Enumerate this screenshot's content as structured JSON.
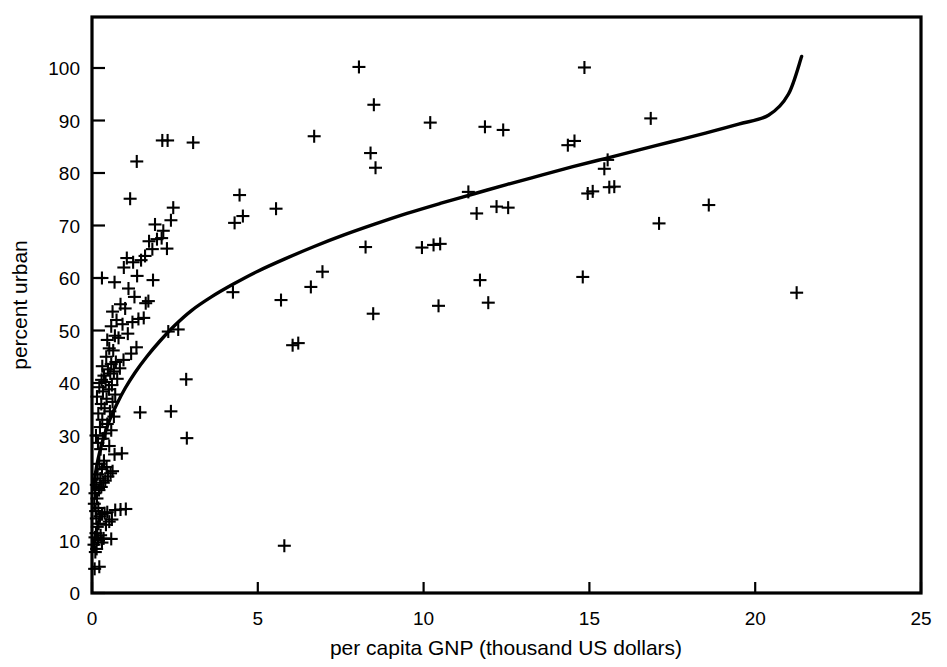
{
  "chart_data": {
    "type": "scatter",
    "title": "",
    "xlabel": "per capita GNP (thousand US dollars)",
    "ylabel": "percent urban",
    "xlim": [
      0,
      25
    ],
    "ylim": [
      0,
      100
    ],
    "xticks": [
      0,
      5,
      10,
      15,
      20,
      25
    ],
    "yticks": [
      0,
      10,
      20,
      30,
      40,
      50,
      60,
      70,
      80,
      90,
      100
    ],
    "xtick_labels": [
      "0",
      "5",
      "10",
      "15",
      "20",
      "25"
    ],
    "ytick_labels": [
      "0",
      "10",
      "20",
      "30",
      "40",
      "50",
      "60",
      "70",
      "80",
      "90",
      "100"
    ],
    "grid": false,
    "legend": null,
    "marker": "plus",
    "series": [
      {
        "name": "countries",
        "marker": "+",
        "points": [
          [
            0.08,
            4.6
          ],
          [
            0.22,
            5.0
          ],
          [
            0.1,
            7.8
          ],
          [
            0.14,
            8.4
          ],
          [
            0.06,
            9.2
          ],
          [
            0.3,
            9.6
          ],
          [
            0.18,
            10.2
          ],
          [
            0.09,
            10.6
          ],
          [
            0.26,
            11.0
          ],
          [
            0.12,
            11.4
          ],
          [
            0.35,
            10.4
          ],
          [
            0.58,
            10.3
          ],
          [
            0.16,
            12.6
          ],
          [
            0.2,
            13.2
          ],
          [
            0.42,
            13.0
          ],
          [
            0.52,
            13.6
          ],
          [
            0.6,
            14.0
          ],
          [
            0.13,
            14.2
          ],
          [
            0.24,
            14.6
          ],
          [
            0.3,
            15.0
          ],
          [
            0.38,
            15.2
          ],
          [
            0.46,
            15.4
          ],
          [
            0.7,
            15.8
          ],
          [
            0.86,
            15.9
          ],
          [
            1.02,
            16.0
          ],
          [
            0.11,
            15.6
          ],
          [
            0.19,
            16.2
          ],
          [
            0.07,
            17.0
          ],
          [
            0.15,
            18.0
          ],
          [
            0.09,
            19.0
          ],
          [
            0.21,
            19.6
          ],
          [
            0.28,
            20.2
          ],
          [
            0.13,
            20.6
          ],
          [
            0.34,
            21.0
          ],
          [
            0.4,
            21.4
          ],
          [
            0.25,
            21.8
          ],
          [
            0.48,
            22.2
          ],
          [
            0.17,
            22.6
          ],
          [
            0.56,
            22.8
          ],
          [
            0.62,
            23.2
          ],
          [
            0.3,
            23.6
          ],
          [
            0.44,
            24.0
          ],
          [
            0.22,
            24.6
          ],
          [
            0.36,
            25.2
          ],
          [
            0.68,
            26.4
          ],
          [
            0.9,
            26.6
          ],
          [
            2.86,
            29.5
          ],
          [
            0.26,
            27.4
          ],
          [
            0.52,
            28.0
          ],
          [
            0.18,
            28.6
          ],
          [
            0.33,
            29.4
          ],
          [
            0.12,
            30.0
          ],
          [
            0.41,
            30.4
          ],
          [
            0.58,
            31.0
          ],
          [
            0.24,
            31.6
          ],
          [
            0.46,
            32.2
          ],
          [
            0.31,
            33.0
          ],
          [
            0.66,
            33.6
          ],
          [
            0.19,
            34.2
          ],
          [
            0.54,
            34.6
          ],
          [
            1.45,
            34.4
          ],
          [
            2.38,
            34.6
          ],
          [
            0.38,
            35.2
          ],
          [
            0.28,
            36.0
          ],
          [
            0.62,
            36.4
          ],
          [
            0.44,
            37.0
          ],
          [
            0.15,
            37.4
          ],
          [
            0.7,
            37.8
          ],
          [
            0.33,
            38.4
          ],
          [
            0.51,
            38.8
          ],
          [
            0.22,
            39.2
          ],
          [
            0.6,
            39.6
          ],
          [
            0.41,
            40.2
          ],
          [
            0.29,
            40.6
          ],
          [
            0.76,
            40.8
          ],
          [
            2.84,
            40.7
          ],
          [
            0.36,
            41.4
          ],
          [
            0.55,
            41.8
          ],
          [
            0.66,
            42.2
          ],
          [
            0.48,
            42.6
          ],
          [
            0.84,
            42.8
          ],
          [
            0.31,
            43.2
          ],
          [
            0.58,
            43.6
          ],
          [
            0.72,
            44.0
          ],
          [
            0.95,
            44.4
          ],
          [
            0.43,
            45.0
          ],
          [
            1.18,
            45.6
          ],
          [
            0.64,
            46.2
          ],
          [
            0.52,
            46.6
          ],
          [
            1.34,
            46.8
          ],
          [
            6.05,
            47.2
          ],
          [
            6.22,
            47.6
          ],
          [
            0.46,
            48.2
          ],
          [
            0.8,
            48.6
          ],
          [
            0.69,
            49.0
          ],
          [
            1.08,
            49.4
          ],
          [
            2.3,
            49.8
          ],
          [
            2.6,
            50.2
          ],
          [
            0.58,
            50.8
          ],
          [
            0.92,
            51.2
          ],
          [
            1.22,
            51.6
          ],
          [
            0.74,
            52.0
          ],
          [
            1.4,
            52.2
          ],
          [
            1.56,
            52.4
          ],
          [
            8.48,
            53.2
          ],
          [
            0.62,
            53.6
          ],
          [
            1.0,
            54.2
          ],
          [
            10.45,
            54.7
          ],
          [
            0.86,
            55.0
          ],
          [
            1.62,
            55.2
          ],
          [
            1.7,
            55.6
          ],
          [
            5.7,
            55.8
          ],
          [
            11.95,
            55.3
          ],
          [
            1.28,
            56.4
          ],
          [
            4.25,
            57.3
          ],
          [
            21.25,
            57.2
          ],
          [
            1.1,
            58.0
          ],
          [
            6.6,
            58.3
          ],
          [
            0.68,
            59.2
          ],
          [
            1.84,
            59.6
          ],
          [
            11.7,
            59.6
          ],
          [
            14.8,
            60.2
          ],
          [
            0.3,
            60.0
          ],
          [
            1.36,
            60.4
          ],
          [
            6.95,
            61.2
          ],
          [
            0.96,
            62.0
          ],
          [
            1.24,
            63.0
          ],
          [
            1.48,
            63.4
          ],
          [
            1.05,
            63.8
          ],
          [
            1.6,
            64.2
          ],
          [
            8.25,
            65.9
          ],
          [
            9.95,
            65.8
          ],
          [
            1.82,
            65.5
          ],
          [
            2.26,
            65.6
          ],
          [
            10.3,
            66.3
          ],
          [
            10.5,
            66.5
          ],
          [
            1.72,
            67.0
          ],
          [
            1.96,
            67.4
          ],
          [
            2.1,
            67.6
          ],
          [
            4.3,
            70.5
          ],
          [
            2.15,
            69.0
          ],
          [
            1.9,
            70.2
          ],
          [
            11.6,
            72.3
          ],
          [
            2.38,
            71.0
          ],
          [
            4.55,
            71.8
          ],
          [
            2.45,
            73.4
          ],
          [
            12.55,
            73.4
          ],
          [
            12.2,
            73.6
          ],
          [
            5.55,
            73.2
          ],
          [
            18.6,
            73.9
          ],
          [
            1.15,
            75.1
          ],
          [
            17.1,
            70.4
          ],
          [
            11.35,
            76.4
          ],
          [
            14.95,
            76.1
          ],
          [
            15.1,
            76.5
          ],
          [
            4.45,
            75.8
          ],
          [
            15.6,
            77.3
          ],
          [
            15.75,
            77.4
          ],
          [
            15.45,
            80.8
          ],
          [
            8.55,
            81.0
          ],
          [
            1.35,
            82.2
          ],
          [
            15.55,
            82.5
          ],
          [
            8.4,
            83.8
          ],
          [
            14.35,
            85.3
          ],
          [
            14.55,
            86.1
          ],
          [
            2.12,
            86.2
          ],
          [
            2.28,
            86.2
          ],
          [
            3.05,
            85.8
          ],
          [
            6.7,
            87.0
          ],
          [
            12.4,
            88.2
          ],
          [
            11.85,
            88.8
          ],
          [
            10.2,
            89.6
          ],
          [
            16.85,
            90.4
          ],
          [
            8.5,
            93.0
          ],
          [
            8.05,
            100.2
          ],
          [
            14.85,
            100.1
          ],
          [
            5.8,
            9.0
          ]
        ]
      }
    ],
    "fit_curve": {
      "name": "log-fit",
      "description": "smooth increasing logarithmic fit line",
      "points": [
        [
          0.05,
          20.0
        ],
        [
          0.1,
          22.6
        ],
        [
          0.18,
          25.4
        ],
        [
          0.28,
          28.0
        ],
        [
          0.4,
          30.6
        ],
        [
          0.55,
          33.2
        ],
        [
          0.75,
          36.0
        ],
        [
          1.0,
          39.0
        ],
        [
          1.3,
          42.0
        ],
        [
          1.65,
          45.0
        ],
        [
          2.05,
          48.0
        ],
        [
          2.5,
          51.0
        ],
        [
          3.0,
          53.8
        ],
        [
          3.6,
          56.4
        ],
        [
          4.25,
          58.8
        ],
        [
          5.0,
          61.3
        ],
        [
          5.8,
          63.6
        ],
        [
          6.7,
          66.0
        ],
        [
          7.6,
          68.2
        ],
        [
          8.5,
          70.2
        ],
        [
          9.5,
          72.3
        ],
        [
          10.5,
          74.2
        ],
        [
          11.5,
          76.0
        ],
        [
          12.5,
          77.8
        ],
        [
          13.5,
          79.5
        ],
        [
          14.5,
          81.2
        ],
        [
          15.5,
          82.8
        ],
        [
          16.5,
          84.4
        ],
        [
          17.5,
          86.0
        ],
        [
          18.5,
          87.6
        ],
        [
          19.5,
          89.3
        ],
        [
          20.4,
          91.0
        ],
        [
          21.0,
          95.0
        ],
        [
          21.4,
          102.2
        ]
      ]
    }
  },
  "axes": {
    "x_title": "per capita GNP (thousand US dollars)",
    "y_title": "percent urban"
  }
}
